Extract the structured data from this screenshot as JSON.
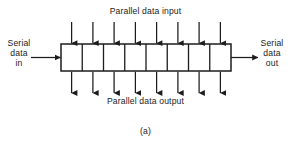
{
  "figure": {
    "caption": "(a)",
    "background_color": "#ffffff",
    "line_color": "#1c1c1c",
    "text_color": "#1c1c1c"
  },
  "labels": {
    "parallel_input": "Parallel data input",
    "parallel_output": "Parallel data output",
    "serial_in_line1": "Serial",
    "serial_in_line2": "data",
    "serial_in_line3": "in",
    "serial_out_line1": "Serial",
    "serial_out_line2": "data",
    "serial_out_line3": "out"
  },
  "register": {
    "cell_count": 8,
    "box_left": 61,
    "box_top": 44,
    "box_right": 231,
    "box_bottom": 71,
    "cell_width": 21.25
  },
  "arrows": {
    "input_arrow_count": 8,
    "output_arrow_count": 8,
    "input_arrow_top_y": 22,
    "output_arrow_bottom_y": 93,
    "serial_in_arrow_x_start": 31,
    "serial_in_arrow_x_end": 61,
    "serial_out_arrow_x_start": 231,
    "serial_out_arrow_x_end": 258,
    "serial_y": 57.5
  },
  "icons": {
    "arrow_down": "arrow-down-icon",
    "arrow_right": "arrow-right-icon"
  }
}
